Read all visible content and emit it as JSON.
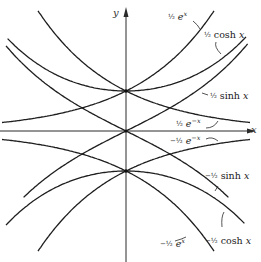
{
  "figure": {
    "type": "diagram",
    "axes": {
      "x_label": "x",
      "y_label": "y",
      "origin_px": [
        126,
        131
      ],
      "scale_px_per_unit": [
        80,
        80
      ]
    },
    "curves": [
      {
        "id": "half_exp_x",
        "label": "½ eˣ",
        "sign": "",
        "coef": "½",
        "func": "e",
        "arg": "x"
      },
      {
        "id": "half_cosh",
        "label": "½ cosh x",
        "sign": "",
        "coef": "½",
        "func": "cosh",
        "arg": "x"
      },
      {
        "id": "half_sinh",
        "label": "½ sinh x",
        "sign": "",
        "coef": "½",
        "func": "sinh",
        "arg": "x"
      },
      {
        "id": "half_exp_negx",
        "label": "½ e⁻ˣ",
        "sign": "",
        "coef": "½",
        "func": "e",
        "arg": "−x"
      },
      {
        "id": "neg_half_exp_negx",
        "label": "−½ e⁻ˣ",
        "sign": "−",
        "coef": "½",
        "func": "e",
        "arg": "−x"
      },
      {
        "id": "neg_half_sinh",
        "label": "−½ sinh x",
        "sign": "−",
        "coef": "½",
        "func": "sinh",
        "arg": "x"
      },
      {
        "id": "neg_half_cosh",
        "label": "−½ cosh x",
        "sign": "−",
        "coef": "½",
        "func": "cosh",
        "arg": "x"
      },
      {
        "id": "neg_half_exp_x",
        "label": "−½ eˣ",
        "sign": "−",
        "coef": "½",
        "func": "e",
        "arg": "x"
      }
    ],
    "labels": {
      "half_exp_x": {
        "coef": "½",
        "text": "e",
        "sup": "x"
      },
      "half_cosh": {
        "coef": "½",
        "text": "cosh",
        "var": "x"
      },
      "half_sinh": {
        "coef": "½",
        "text": "sinh",
        "var": "x"
      },
      "half_exp_negx": {
        "coef": "½",
        "text": "e",
        "sup": "−x"
      },
      "neg_half_exp_negx": {
        "coef": "−½",
        "text": "e",
        "sup": "−x"
      },
      "neg_half_sinh": {
        "coef": "−½",
        "text": "sinh",
        "var": "x"
      },
      "neg_half_cosh": {
        "coef": "−½",
        "text": "cosh",
        "var": "x"
      },
      "neg_half_exp_x": {
        "coef": "−½",
        "text": "e",
        "sup": "x"
      }
    }
  }
}
